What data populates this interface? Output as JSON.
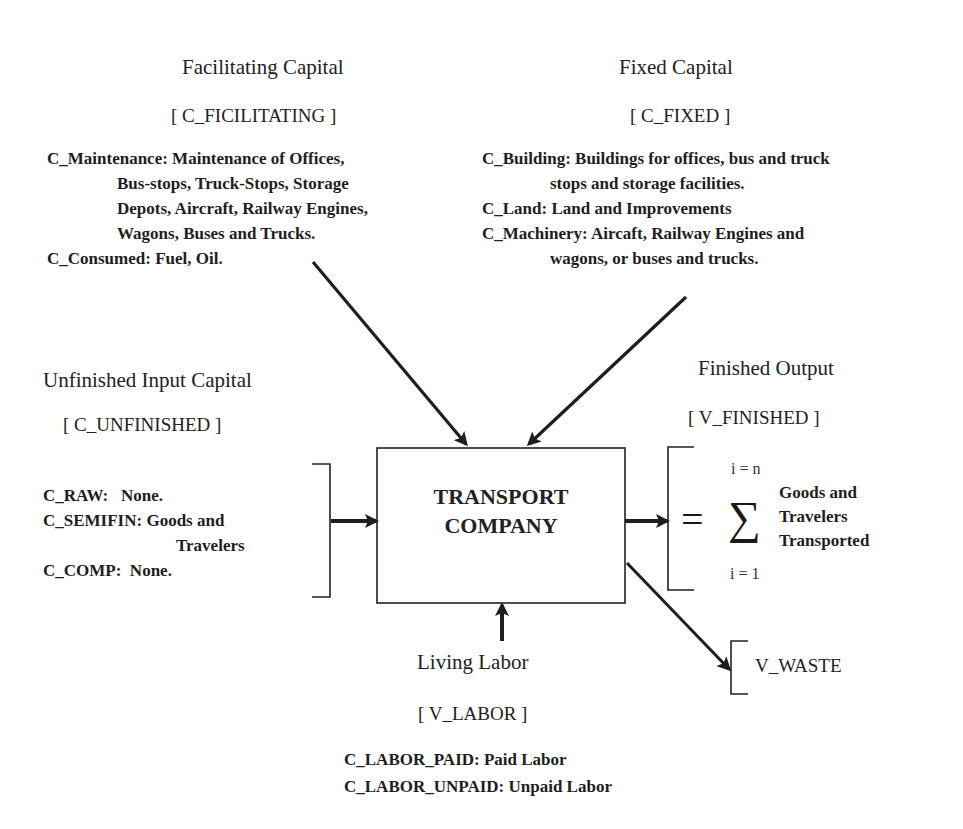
{
  "diagram": {
    "center": {
      "line1": "TRANSPORT",
      "line2": "COMPANY"
    },
    "facilitating_capital": {
      "title": "Facilitating Capital",
      "code": "[ C_FICILITATING ]",
      "lines": [
        "C_Maintenance: Maintenance of Offices,",
        "Bus-stops, Truck-Stops, Storage",
        "Depots, Aircraft, Railway Engines,",
        "Wagons, Buses and Trucks.",
        "C_Consumed: Fuel, Oil."
      ]
    },
    "fixed_capital": {
      "title": "Fixed Capital",
      "code": "[ C_FIXED ]",
      "lines": [
        "C_Building: Buildings for offices, bus and truck",
        "stops and storage facilities.",
        "C_Land: Land and Improvements",
        "C_Machinery: Aircaft, Railway Engines and",
        "wagons, or buses and trucks."
      ]
    },
    "unfinished_input_capital": {
      "title": "Unfinished Input Capital",
      "code": "[ C_UNFINISHED ]",
      "lines": [
        "C_RAW:   None.",
        "C_SEMIFIN: Goods and",
        "Travelers",
        "C_COMP:  None."
      ]
    },
    "finished_output": {
      "title": "Finished Output",
      "code": "[ V_FINISHED ]",
      "equals": "=",
      "sigma": "∑",
      "upper_limit": "i = n",
      "lower_limit": "i = 1",
      "lines": [
        "Goods and",
        "Travelers",
        "Transported"
      ]
    },
    "waste": {
      "code": "V_WASTE"
    },
    "living_labor": {
      "title": "Living Labor",
      "code": "[ V_LABOR ]",
      "lines": [
        "C_LABOR_PAID: Paid Labor",
        "C_LABOR_UNPAID: Unpaid Labor"
      ]
    },
    "colors": {
      "ink": "#1e1e1e",
      "background": "#ffffff"
    }
  }
}
